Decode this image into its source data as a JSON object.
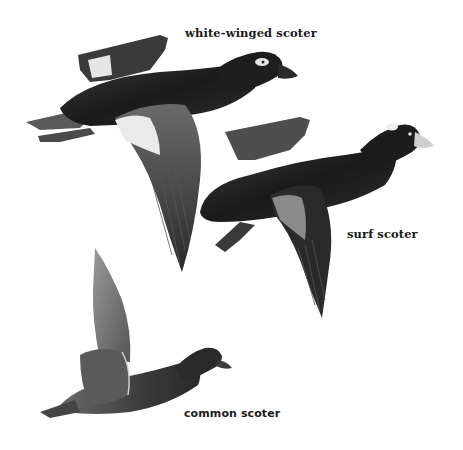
{
  "plate": {
    "birds": [
      {
        "name": "white-winged scoter",
        "label": "white-winged scoter"
      },
      {
        "name": "surf scoter",
        "label": "surf scoter"
      },
      {
        "name": "common scoter",
        "label": "common scoter"
      }
    ],
    "colors": {
      "background": "#ffffff",
      "plumage_dark": "#1c1c1c",
      "plumage_mid": "#4a4a4a",
      "plumage_light": "#8a8a8a",
      "wing_patch": "#e8e8e8"
    }
  }
}
